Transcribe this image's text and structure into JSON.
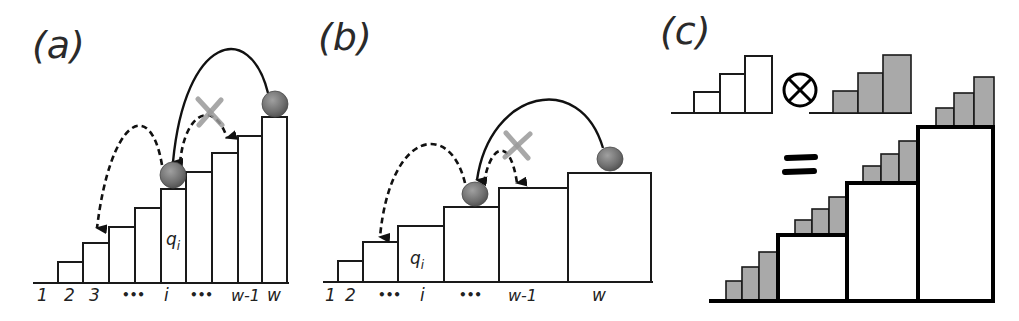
{
  "figure": {
    "panels": [
      {
        "id": "a",
        "label": "(a)",
        "x_labels": [
          "1",
          "2",
          "3",
          "•••",
          "i",
          "•••",
          "w-1",
          "w"
        ],
        "bar_label": "q",
        "bar_label_sub": "i",
        "description": "Staircase of equal-width bars; ball jumps from top bar w back to bar i, then dashed jump to bar 3; crossed-out dashed jump forward to higher bar"
      },
      {
        "id": "b",
        "label": "(b)",
        "x_labels": [
          "1",
          "2",
          "•••",
          "i",
          "•••",
          "w-1",
          "w"
        ],
        "bar_label": "q",
        "bar_label_sub": "i",
        "description": "Staircase of increasing-width bars; ball jumps from bar w back to lower bar, dashed jump to bar 2; crossed-out dashed jump forward"
      },
      {
        "id": "c",
        "label": "(c)",
        "operator": "⊗",
        "equals": "=",
        "description": "White 3-step staircase tensor gray 3-step staircase equals nested staircase of white boxes topped with gray steps"
      }
    ],
    "colors": {
      "ink": "#1a1a1a",
      "ball": "#7a7a7a",
      "cross": "#9a9a9a",
      "gray_fill": "#a9a9a9",
      "background": "#ffffff"
    }
  }
}
